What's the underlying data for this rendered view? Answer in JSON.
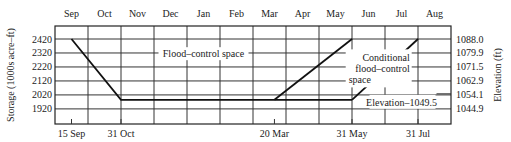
{
  "chart_data": {
    "type": "line",
    "title": "",
    "x_top_labels": [
      "Sep",
      "Oct",
      "Nov",
      "Dec",
      "Jan",
      "Feb",
      "Mar",
      "Apr",
      "May",
      "Jun",
      "Jul",
      "Aug"
    ],
    "x_bottom_labels": [
      {
        "label": "15 Sep",
        "month_pos": 0.5
      },
      {
        "label": "31 Oct",
        "month_pos": 2.0
      },
      {
        "label": "20 Mar",
        "month_pos": 6.65
      },
      {
        "label": "31 May",
        "month_pos": 9.0
      },
      {
        "label": "31 Jul",
        "month_pos": 11.0
      }
    ],
    "ylabel": "Storage (1000s acre–ft)",
    "y2label": "Elevation (ft)",
    "ylim": [
      1812,
      2513
    ],
    "yticks": [
      2420,
      2320,
      2220,
      2120,
      2020,
      1920
    ],
    "y2ticks": [
      "1088.0",
      "1079.9",
      "1071.5",
      "1062.9",
      "1054.1",
      "1044.9"
    ],
    "grid": true,
    "series": [
      {
        "name": "Flood-control rule curve",
        "points": [
          [
            0.5,
            2420
          ],
          [
            2.0,
            1985
          ],
          [
            9.0,
            1985
          ]
        ]
      },
      {
        "name": "Conditional flood-control start (20 Mar)",
        "points": [
          [
            6.65,
            1985
          ],
          [
            9.0,
            2420
          ]
        ]
      },
      {
        "name": "Conditional flood-control end (31 Jul)",
        "points": [
          [
            9.0,
            1985
          ],
          [
            11.0,
            2420
          ]
        ]
      }
    ],
    "annotations": [
      {
        "text": "Flood–control space",
        "x": 4.5,
        "y": 2290
      },
      {
        "text": [
          "Conditional",
          "flood–control",
          "space"
        ],
        "x": 9.9,
        "y": 2260
      },
      {
        "text": "Elevation–1049.5",
        "x": 10.5,
        "y": 1985
      }
    ]
  }
}
